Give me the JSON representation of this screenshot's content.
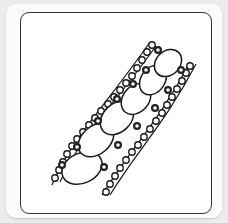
{
  "image": {
    "description": "Zentangle-style pattern tile: diagonal band of small circles along two curved rails enclosing five large ovals",
    "colors": {
      "background": "#ececec",
      "tile": "#fbfbfb",
      "frame": "#333333",
      "ink": "#1a1a1a",
      "paper": "#ffffff"
    },
    "ovals": [
      {
        "cx": 80,
        "cy": 162,
        "rx": 22,
        "ry": 17,
        "rot": -30
      },
      {
        "cx": 97,
        "cy": 134,
        "rx": 21,
        "ry": 16,
        "rot": -45
      },
      {
        "cx": 120,
        "cy": 112,
        "rx": 20,
        "ry": 15,
        "rot": -50
      },
      {
        "cx": 139,
        "cy": 93,
        "rx": 18,
        "ry": 14,
        "rot": -55
      },
      {
        "cx": 155,
        "cy": 75,
        "rx": 17,
        "ry": 13,
        "rot": -55
      },
      {
        "cx": 170,
        "cy": 60,
        "rx": 15,
        "ry": 13,
        "rot": -50
      }
    ]
  }
}
